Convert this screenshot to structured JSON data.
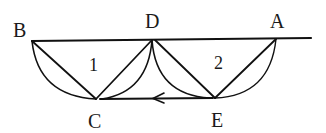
{
  "diagram": {
    "points": {
      "B": {
        "label": "B",
        "x": 32,
        "y": 41
      },
      "D": {
        "label": "D",
        "x": 152,
        "y": 40
      },
      "A": {
        "label": "A",
        "x": 276,
        "y": 39
      },
      "C": {
        "label": "C",
        "x": 96,
        "y": 99
      },
      "E": {
        "label": "E",
        "x": 215,
        "y": 98
      }
    },
    "regions": {
      "region1": {
        "label": "1"
      },
      "region2": {
        "label": "2"
      }
    },
    "arrow": {
      "from": "E",
      "to": "C",
      "direction": "left"
    },
    "colors": {
      "stroke": "#111111",
      "background": "#ffffff"
    }
  }
}
